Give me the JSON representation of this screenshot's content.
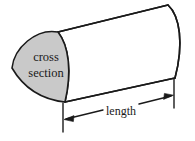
{
  "figure": {
    "name": "prism-cross-section-diagram",
    "background_color": "#ffffff",
    "stroke_color": "#1a1a1a",
    "cross_section_fill": "#c9c9c9",
    "body_fill": "#ffffff",
    "labels": {
      "cross_line1": "cross",
      "cross_line2": "section",
      "length": "length"
    }
  }
}
